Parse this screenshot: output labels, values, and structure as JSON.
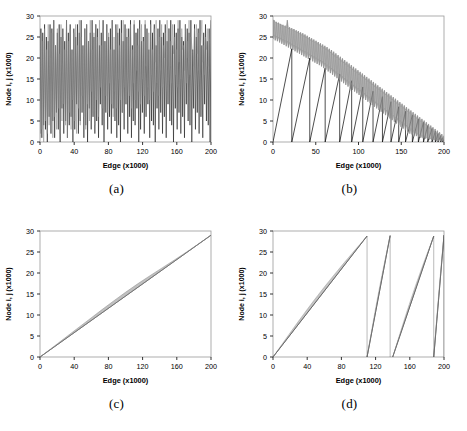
{
  "figure": {
    "background": "#ffffff",
    "series_colors": {
      "primary": "#000000",
      "secondary": "#8c8c8c"
    }
  },
  "chart_data": [
    {
      "type": "line",
      "panel": "a",
      "caption": "(a)",
      "title": "",
      "xlabel": "Edge (x1000)",
      "ylabel": "Node i, j (x1000)",
      "xlim": [
        0,
        200
      ],
      "ylim": [
        0,
        30
      ],
      "xticks": [
        0,
        40,
        80,
        120,
        160,
        200
      ],
      "yticks": [
        0,
        5,
        10,
        15,
        20,
        25,
        30
      ],
      "grid": false,
      "legend": "none",
      "description": "Two overlaid high-frequency oscillating traces (black and gray) spanning nearly the full node range with no ordering structure.",
      "series": [
        {
          "name": "node i",
          "color": "#000000",
          "pattern": "random-oscillation",
          "range": [
            0,
            29
          ],
          "samples": [
            2,
            27,
            1,
            26,
            4,
            28,
            3,
            25,
            0,
            24,
            6,
            28,
            2,
            27,
            5,
            29,
            1,
            23,
            7,
            26,
            3,
            28,
            0,
            25,
            8,
            27,
            2,
            24,
            5,
            29,
            1,
            26,
            4,
            28,
            6,
            22,
            0,
            27,
            3,
            25,
            9,
            28,
            2,
            26,
            5,
            29,
            7,
            23,
            1,
            27,
            4,
            28,
            0,
            24,
            8,
            26,
            3,
            29,
            6,
            25,
            2,
            28,
            5,
            27,
            1,
            23,
            9,
            26,
            4,
            29,
            0,
            24,
            7,
            28,
            3,
            25,
            6,
            27,
            2,
            29,
            8,
            22,
            5,
            28,
            1,
            26,
            4,
            27,
            0,
            29,
            7,
            24,
            3,
            28,
            9,
            25,
            2,
            27,
            6,
            29,
            1,
            23,
            5,
            28,
            4,
            26,
            8,
            27,
            0,
            29,
            3,
            24,
            7,
            25,
            2,
            28,
            6,
            27,
            9,
            22,
            1,
            29,
            5,
            26,
            4,
            28,
            0,
            23,
            8,
            27,
            3,
            29,
            7,
            25,
            2,
            26,
            6,
            28,
            1,
            24,
            9,
            27,
            5,
            29,
            4,
            23,
            0,
            28,
            8,
            26,
            3,
            27,
            7,
            29,
            2,
            25,
            6,
            24,
            1,
            28,
            9,
            27,
            5,
            26,
            4,
            29,
            0,
            22,
            8,
            28,
            3,
            25,
            7,
            27,
            2,
            29,
            6,
            23,
            1,
            26,
            9,
            28,
            5,
            24,
            4,
            27,
            0,
            29
          ]
        },
        {
          "name": "node j",
          "color": "#8c8c8c",
          "pattern": "random-oscillation-rising-floor",
          "range": [
            0,
            29
          ],
          "samples": [
            1,
            26,
            3,
            24,
            0,
            27,
            5,
            22,
            2,
            28,
            4,
            20,
            7,
            26,
            1,
            29,
            6,
            23,
            3,
            27,
            8,
            21,
            2,
            28,
            5,
            25,
            9,
            22,
            4,
            29,
            1,
            24,
            7,
            27,
            3,
            20,
            10,
            26,
            5,
            28,
            2,
            23,
            8,
            29,
            4,
            25,
            11,
            21,
            6,
            27,
            3,
            28,
            9,
            24,
            5,
            29,
            12,
            22,
            7,
            26,
            4,
            28,
            10,
            25,
            6,
            29,
            13,
            23,
            8,
            27,
            5,
            24,
            11,
            28,
            7,
            26,
            14,
            22,
            9,
            29,
            6,
            25,
            12,
            27,
            8,
            28,
            15,
            23,
            10,
            26,
            7,
            29,
            13,
            24,
            9,
            27,
            16,
            25,
            11,
            28,
            8,
            22,
            14,
            29,
            10,
            26,
            17,
            23,
            12,
            27,
            9,
            28,
            15,
            24,
            11,
            29,
            18,
            25,
            13,
            26,
            10,
            28,
            16,
            22,
            12,
            27,
            19,
            29,
            14,
            24,
            11,
            25,
            17,
            28,
            13,
            23,
            20,
            26,
            15,
            29,
            12,
            27,
            18,
            24,
            14,
            28,
            21,
            25,
            16,
            22,
            13,
            29,
            19,
            26,
            15,
            27,
            22,
            23,
            17,
            28,
            14,
            24,
            20,
            29,
            16,
            25,
            23,
            21,
            18,
            27,
            15,
            28,
            21,
            26,
            17,
            22,
            24,
            29,
            19,
            23,
            16,
            25,
            22,
            27,
            18,
            24,
            25,
            28
          ]
        }
      ]
    },
    {
      "type": "line",
      "panel": "b",
      "caption": "(b)",
      "title": "",
      "xlabel": "Edge (x1000)",
      "ylabel": "Node i, j (x1000)",
      "xlim": [
        0,
        200
      ],
      "ylim": [
        0,
        30
      ],
      "xticks": [
        0,
        50,
        100,
        150,
        200
      ],
      "yticks": [
        0,
        5,
        10,
        15,
        20,
        25,
        30
      ],
      "grid": false,
      "legend": "none",
      "description": "Black sawtooth ramps of progressively decreasing period and amplitude, overlaid with a noisy gray band decaying from about 27 to 2.",
      "series": [
        {
          "name": "node i sawtooth",
          "color": "#000000",
          "pattern": "sawtooth-decaying",
          "teeth": [
            {
              "x0": 0,
              "x1": 22,
              "ypeak": 22.2
            },
            {
              "x0": 22,
              "x1": 43,
              "ypeak": 20.0
            },
            {
              "x0": 43,
              "x1": 61,
              "ypeak": 17.6
            },
            {
              "x0": 61,
              "x1": 78,
              "ypeak": 16.2
            },
            {
              "x0": 78,
              "x1": 92,
              "ypeak": 14.6
            },
            {
              "x0": 92,
              "x1": 105,
              "ypeak": 13.1
            },
            {
              "x0": 105,
              "x1": 117,
              "ypeak": 12.1
            },
            {
              "x0": 117,
              "x1": 128,
              "ypeak": 10.8
            },
            {
              "x0": 128,
              "x1": 138,
              "ypeak": 9.6
            },
            {
              "x0": 138,
              "x1": 147,
              "ypeak": 8.4
            },
            {
              "x0": 147,
              "x1": 155,
              "ypeak": 7.3
            },
            {
              "x0": 155,
              "x1": 163,
              "ypeak": 6.4
            },
            {
              "x0": 163,
              "x1": 170,
              "ypeak": 5.5
            },
            {
              "x0": 170,
              "x1": 176,
              "ypeak": 4.7
            },
            {
              "x0": 176,
              "x1": 181,
              "ypeak": 3.9
            },
            {
              "x0": 181,
              "x1": 186,
              "ypeak": 3.2
            },
            {
              "x0": 186,
              "x1": 190,
              "ypeak": 2.6
            },
            {
              "x0": 190,
              "x1": 193,
              "ypeak": 2.0
            },
            {
              "x0": 193,
              "x1": 196,
              "ypeak": 1.5
            },
            {
              "x0": 196,
              "x1": 198,
              "ypeak": 1.0
            },
            {
              "x0": 198,
              "x1": 200,
              "ypeak": 0.6
            }
          ]
        },
        {
          "name": "node j band",
          "color": "#8c8c8c",
          "pattern": "noisy-decaying-band",
          "envelope_upper": [
            29,
            29,
            28.5,
            28.6,
            28.2,
            28.4,
            28,
            28.1,
            27.6,
            27.9,
            27.4,
            27.7,
            27.2,
            29,
            27,
            27.3,
            26.8,
            27.1,
            26.5,
            26.9,
            26.2,
            26.6,
            26,
            26.4,
            25.7,
            26.1,
            25.4,
            25.9,
            25.1,
            25.6,
            24.8,
            25.3,
            24.5,
            25,
            24.2,
            24.7,
            23.9,
            24.4,
            23.6,
            24.1,
            23.3,
            23.8,
            23,
            23.5,
            22.6,
            23.2,
            22.3,
            22.9,
            22,
            22.6,
            21.6,
            22.2,
            21.2,
            21.9,
            20.8,
            21.5,
            20.4,
            21.1,
            20,
            20.7,
            19.6,
            20.3,
            19.2,
            19.9,
            18.8,
            19.5,
            18.4,
            19.1,
            18,
            18.7,
            17.6,
            18.3,
            17.2,
            17.9,
            16.8,
            17.5,
            16.4,
            17.1,
            16,
            16.7,
            15.6,
            16.3,
            15.2,
            15.9,
            14.8,
            15.5,
            14.4,
            15.1,
            14,
            14.7,
            13.6,
            14.3,
            13.2,
            13.9,
            12.8,
            13.5,
            12.4,
            13.1,
            12,
            12.7,
            11.6,
            12.3,
            11.2,
            11.9,
            10.8,
            11.5,
            10.4,
            11.1,
            10,
            10.7,
            9.6,
            10.3,
            9.2,
            9.9,
            8.8,
            9.5,
            8.4,
            9.1,
            8,
            8.7,
            7.6,
            8.3,
            7.2,
            7.9,
            6.8,
            7.5,
            6.4,
            7.1,
            6,
            6.7,
            5.6,
            6.3,
            5.2,
            5.9,
            4.8,
            5.5,
            4.4,
            5.1,
            4,
            4.7,
            3.6,
            4.3,
            3.2,
            3.9,
            2.8,
            3.5,
            2.4,
            3.1,
            2,
            2.7,
            1.6,
            2.3,
            1.2,
            1.9,
            0.8,
            1.5
          ],
          "envelope_lower": [
            24.5,
            25.5,
            24.2,
            25.2,
            24,
            25,
            23.7,
            24.8,
            23.4,
            24.5,
            23.1,
            24.2,
            22.8,
            24,
            22.5,
            23.7,
            22.2,
            23.4,
            21.9,
            23.1,
            21.6,
            22.8,
            21.3,
            22.5,
            21,
            22.2,
            20.7,
            21.9,
            20.4,
            21.6,
            20.1,
            21.3,
            19.8,
            21,
            19.5,
            20.7,
            19.2,
            20.4,
            18.9,
            20.1,
            18.6,
            19.8,
            18.3,
            19.5,
            18,
            19.2,
            17.6,
            18.8,
            17.2,
            18.4,
            16.8,
            18,
            16.4,
            17.6,
            16,
            17.2,
            15.6,
            16.8,
            15.2,
            16.4,
            14.8,
            16,
            14.4,
            15.6,
            14,
            15.2,
            13.6,
            14.8,
            13.2,
            14.4,
            12.8,
            14,
            12.4,
            13.6,
            12,
            13.2,
            11.6,
            12.8,
            11.2,
            12.4,
            10.8,
            12,
            10.4,
            11.6,
            10,
            11.2,
            9.6,
            10.8,
            9.2,
            10.4,
            8.8,
            10,
            8.4,
            9.6,
            8,
            9.2,
            7.6,
            8.8,
            7.2,
            8.4,
            6.8,
            8,
            6.4,
            7.6,
            6,
            7.2,
            5.6,
            6.8,
            5.2,
            6.4,
            4.8,
            6,
            4.4,
            5.6,
            4,
            5.2,
            3.6,
            4.8,
            3.2,
            4.4,
            2.8,
            4,
            2.4,
            3.6,
            2,
            3.2,
            1.8,
            2.8,
            1.6,
            2.4,
            1.4,
            2,
            1.2,
            1.8,
            1,
            1.6,
            0.9,
            1.4,
            0.8,
            1.2,
            0.7,
            1,
            0.6,
            0.9,
            0.5,
            0.8,
            0.4,
            0.7,
            0.3,
            0.6,
            0.25,
            0.5,
            0.2,
            0.4,
            0.15,
            0.3,
            0.1,
            0.2
          ]
        }
      ]
    },
    {
      "type": "line",
      "panel": "c",
      "caption": "(c)",
      "title": "",
      "xlabel": "Edge (x1000)",
      "ylabel": "Node i, j (x1000)",
      "xlim": [
        0,
        200
      ],
      "ylim": [
        0,
        30
      ],
      "xticks": [
        0,
        40,
        80,
        120,
        160,
        200
      ],
      "yticks": [
        0,
        5,
        10,
        15,
        20,
        25,
        30
      ],
      "grid": false,
      "legend": "none",
      "description": "A single monotonically increasing diagonal from (0,0) to (200,29): a thin black line with a slightly thicker gray band riding just above it, widest near the middle of the range.",
      "series": [
        {
          "name": "node i",
          "color": "#000000",
          "pattern": "linear",
          "points": [
            [
              0,
              0
            ],
            [
              200,
              29
            ]
          ]
        },
        {
          "name": "node j",
          "color": "#8c8c8c",
          "pattern": "linear-band",
          "points": [
            [
              0,
              0
            ],
            [
              200,
              29
            ]
          ],
          "band_halfwidth": [
            0,
            0.15,
            0.3,
            0.45,
            0.6,
            0.75,
            0.85,
            0.9,
            0.85,
            0.7,
            0.5,
            0.3,
            0.15,
            0.05,
            0
          ]
        }
      ]
    },
    {
      "type": "line",
      "panel": "d",
      "caption": "(d)",
      "title": "",
      "xlabel": "Edge (x1000)",
      "ylabel": "Node i, j (x1000)",
      "xlim": [
        0,
        200
      ],
      "ylim": [
        0,
        30
      ],
      "xticks": [
        0,
        40,
        80,
        120,
        160,
        200
      ],
      "yticks": [
        0,
        5,
        10,
        15,
        20,
        25,
        30
      ],
      "grid": false,
      "legend": "none",
      "description": "Piecewise sawtooth of four rising diagonal segments each climbing from 0 to about 29, with resets near edge 110, 137 and 188.",
      "series": [
        {
          "name": "node i",
          "color": "#000000",
          "pattern": "sawtooth-segments",
          "segments": [
            {
              "x0": 0,
              "y0": 0,
              "x1": 110,
              "y1": 28.8
            },
            {
              "x0": 110,
              "y0": 0,
              "x1": 137,
              "y1": 28.9
            },
            {
              "x0": 140,
              "y0": 0,
              "x1": 188,
              "y1": 28.8
            },
            {
              "x0": 188,
              "y0": 0,
              "x1": 200,
              "y1": 29.0
            }
          ]
        },
        {
          "name": "node j",
          "color": "#8c8c8c",
          "pattern": "sawtooth-segments-band",
          "segments": [
            {
              "x0": 0,
              "y0": 0,
              "x1": 110,
              "y1": 28.8
            },
            {
              "x0": 110,
              "y0": 0,
              "x1": 137,
              "y1": 28.9
            },
            {
              "x0": 140,
              "y0": 0,
              "x1": 188,
              "y1": 28.8
            },
            {
              "x0": 188,
              "y0": 0,
              "x1": 200,
              "y1": 29.0
            }
          ]
        }
      ]
    }
  ]
}
